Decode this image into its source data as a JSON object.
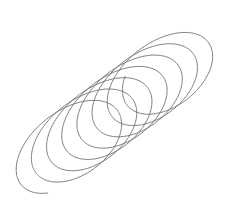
{
  "figure": {
    "stroke_color": "#6e6e6e",
    "background": "#ffffff",
    "turns": 7.25,
    "axis_start": [
      62,
      150
    ],
    "axis_end": [
      172,
      68
    ],
    "radius_major": 56,
    "radius_minor": 34,
    "tilt_deg": -38
  }
}
